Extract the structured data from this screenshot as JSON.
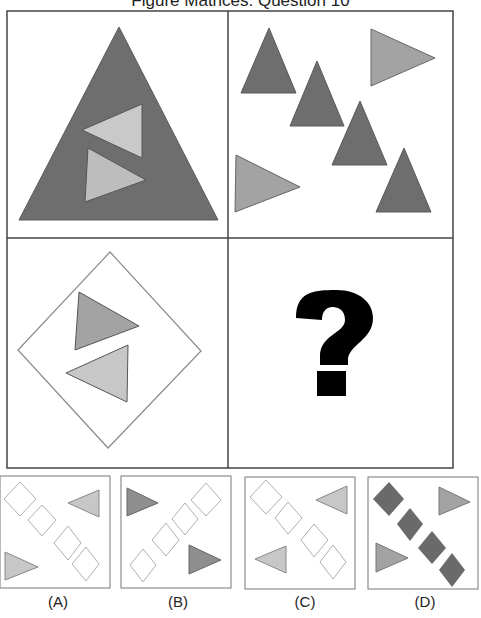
{
  "title": "Figure Matrices: Question 10",
  "colors": {
    "dark_gray": "#6e6e6e",
    "medium_gray": "#a3a3a3",
    "light_gray": "#c7c7c7",
    "outline": "#555555",
    "diamond_outline": "#b0b0b0",
    "question_mark": "#000000"
  },
  "matrix": {
    "cells": [
      {
        "position": "top-left",
        "description": "Large dark triangle containing two light triangles (one pointing left, one pointing right)"
      },
      {
        "position": "top-right",
        "description": "Four dark upward triangles in a diagonal line with two medium right-pointing triangles"
      },
      {
        "position": "bottom-left",
        "description": "Outlined diamond containing a medium right-pointing triangle and a light left-pointing triangle"
      },
      {
        "position": "bottom-right",
        "description": "Missing cell",
        "symbol": "?"
      }
    ]
  },
  "options": [
    {
      "label": "(A)",
      "description": "Four outlined diamonds diagonal; light left-pointing triangle top-right, light right-pointing triangle bottom-left"
    },
    {
      "label": "(B)",
      "description": "Four outlined diamonds anti-diagonal; dark right-pointing triangles top-left and bottom-right"
    },
    {
      "label": "(C)",
      "description": "Four outlined diamonds diagonal; light left-pointing triangles top-right and bottom-left"
    },
    {
      "label": "(D)",
      "description": "Four filled dark diamonds diagonal; medium right-pointing triangles top-right and bottom-left"
    }
  ]
}
